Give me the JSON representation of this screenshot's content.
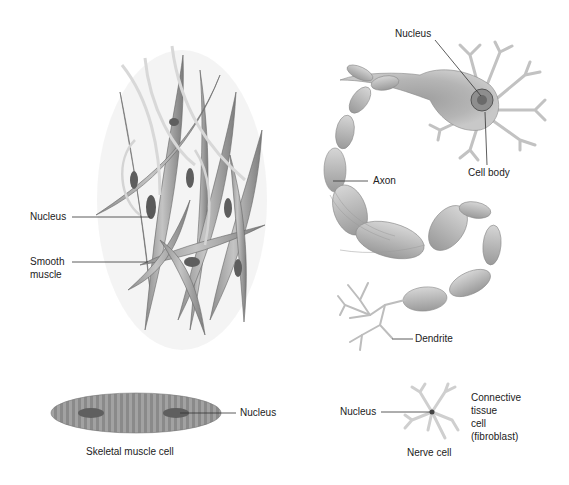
{
  "figure": {
    "palette": {
      "background": "#ffffff",
      "cell_fill": "#a9a9a9",
      "cell_light": "#cfcfcf",
      "cell_dark": "#6e6e6e",
      "nucleus": "#5a5a5a",
      "leader_line": "#333333",
      "text": "#222222"
    },
    "smooth_muscle_panel": {
      "labels": {
        "nucleus": "Nucleus",
        "smooth_muscle_line1": "Smooth",
        "smooth_muscle_line2": "muscle"
      }
    },
    "neuron_panel": {
      "labels": {
        "nucleus": "Nucleus",
        "cell_body": "Cell body",
        "axon": "Axon",
        "dendrite": "Dendrite"
      }
    },
    "skeletal_panel": {
      "labels": {
        "nucleus": "Nucleus",
        "caption": "Skeletal muscle cell"
      }
    },
    "fibroblast_panel": {
      "labels": {
        "nucleus": "Nucleus",
        "title_line1": "Connective",
        "title_line2": "tissue",
        "title_line3": "cell",
        "title_line4": "(fibroblast)",
        "caption": "Nerve cell"
      }
    }
  }
}
